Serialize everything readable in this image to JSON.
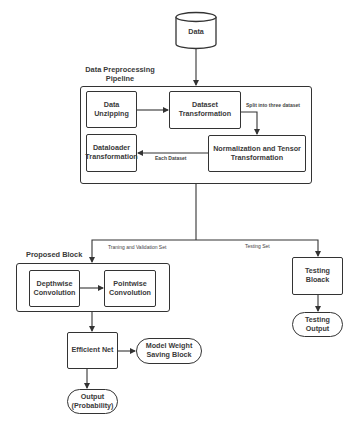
{
  "nodes": {
    "data": "Data",
    "data_unzipping": "Data Unzipping",
    "dataset_transformation": "Dataset Transformation",
    "normalization": "Normalization and Tensor Transformation",
    "dataloader": "Dataloader Transformation",
    "depthwise": "Depthwise Convolution",
    "pointwise": "Pointwise Convolution",
    "efficient_net": "Efficient Net",
    "model_weight": "Model Weight Saving Block",
    "output_probability": "Output (Probability)",
    "testing_block": "Testing Bloack",
    "testing_output": "Testing Output"
  },
  "groups": {
    "pipeline": "Data Preprocessing Pipeline",
    "proposed": "Proposed Block"
  },
  "edges": {
    "split": "Split into three dataset",
    "each_dataset": "Each Dataset",
    "train_val": "Traning and Validation Set",
    "testing_set": "Testing Set"
  }
}
